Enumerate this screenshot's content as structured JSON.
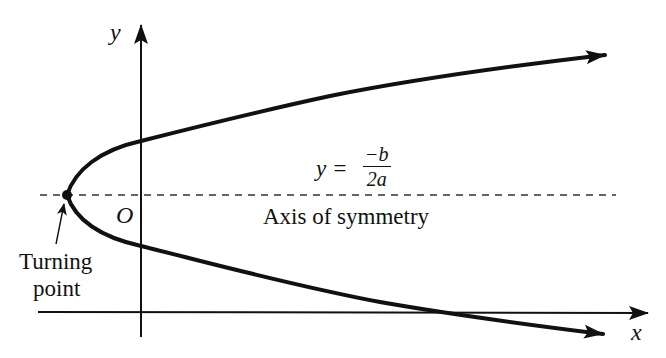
{
  "diagram": {
    "labels": {
      "y_axis": "y",
      "x_axis": "x",
      "origin": "O",
      "equation_lhs": "y =",
      "equation_numerator": "−b",
      "equation_denominator": "2a",
      "axis_of_symmetry": "Axis of symmetry",
      "turning_point_line1": "Turning",
      "turning_point_line2": "point"
    },
    "colors": {
      "ink": "#111111",
      "background": "#ffffff"
    },
    "geometry": {
      "vertex": [
        67,
        195
      ],
      "y_axis_x": 141,
      "x_axis_y": 312,
      "symmetry_line_y": 195,
      "upper_arm_end": [
        605,
        55
      ],
      "lower_arm_end": [
        603,
        334
      ],
      "x_axis_end": [
        648,
        313
      ],
      "y_axis_top": [
        141,
        25
      ]
    }
  }
}
